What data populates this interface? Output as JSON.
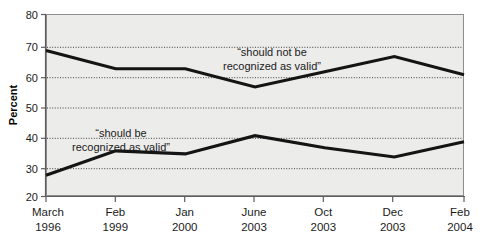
{
  "chart_data": {
    "type": "line",
    "title": "",
    "xlabel": "",
    "ylabel": "Percent",
    "ylim": [
      20,
      80
    ],
    "yticks": [
      20,
      30,
      40,
      50,
      60,
      70,
      80
    ],
    "grid": true,
    "legend_position": "inline-annotation",
    "categories": [
      "March 1996",
      "Feb 1999",
      "Jan 2000",
      "June 2003",
      "Oct 2003",
      "Dec 2003",
      "Feb 2004"
    ],
    "category_lines": [
      [
        "March",
        "1996"
      ],
      [
        "Feb",
        "1999"
      ],
      [
        "Jan",
        "2000"
      ],
      [
        "June",
        "2003"
      ],
      [
        "Oct",
        "2003"
      ],
      [
        "Dec",
        "2003"
      ],
      [
        "Feb",
        "2004"
      ]
    ],
    "series": [
      {
        "name": "“should not be recognized as valid”",
        "annotation_lines": [
          "“should not be",
          "recognized as valid”"
        ],
        "color": "#141414",
        "values": [
          68,
          62,
          62,
          56,
          61,
          66,
          60
        ]
      },
      {
        "name": "“should be recognized as valid”",
        "annotation_lines": [
          "“should be",
          "recognized as valid”"
        ],
        "color": "#141414",
        "values": [
          27,
          35,
          34,
          40,
          36,
          33,
          38
        ]
      }
    ]
  },
  "axis": {
    "y_title": "Percent",
    "y_tick_labels": [
      "80",
      "70",
      "60",
      "50",
      "40",
      "30",
      "20"
    ]
  },
  "annotations": {
    "upper_line_1": "“should not be",
    "upper_line_2": "recognized as valid”",
    "lower_line_1": "“should be",
    "lower_line_2": "recognized as valid”"
  },
  "x_labels": {
    "t0_top": "March",
    "t0_bottom": "1996",
    "t1_top": "Feb",
    "t1_bottom": "1999",
    "t2_top": "Jan",
    "t2_bottom": "2000",
    "t3_top": "June",
    "t3_bottom": "2003",
    "t4_top": "Oct",
    "t4_bottom": "2003",
    "t5_top": "Dec",
    "t5_bottom": "2003",
    "t6_top": "Feb",
    "t6_bottom": "2004"
  },
  "colors": {
    "plot_background": "#ececeb",
    "line": "#141414",
    "grid": "#2b2b2b",
    "axis": "#5d5d5d",
    "text": "#1b1b1b"
  }
}
